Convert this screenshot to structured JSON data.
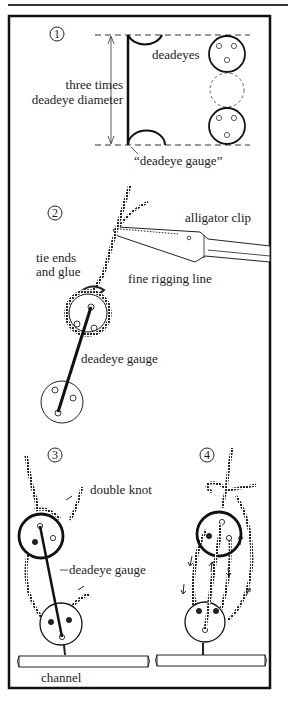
{
  "figure": {
    "type": "rigging illustration",
    "frame": {
      "stroke": "#111111",
      "background": "#ffffff"
    }
  },
  "panels": [
    {
      "number": "1",
      "labels": {
        "deadeyes": "deadeyes",
        "dimension_line1": "three times",
        "dimension_line2": "deadeye diameter",
        "gauge": "“deadeye gauge”"
      }
    },
    {
      "number": "2",
      "labels": {
        "clip": "alligator clip",
        "tie_line1": "tie ends",
        "tie_line2": "and glue",
        "rigging": "fine rigging line",
        "gauge": "deadeye gauge"
      }
    },
    {
      "number": "3",
      "labels": {
        "knot": "double knot",
        "gauge": "deadeye gauge",
        "channel": "channel"
      }
    },
    {
      "number": "4",
      "labels": {}
    }
  ]
}
